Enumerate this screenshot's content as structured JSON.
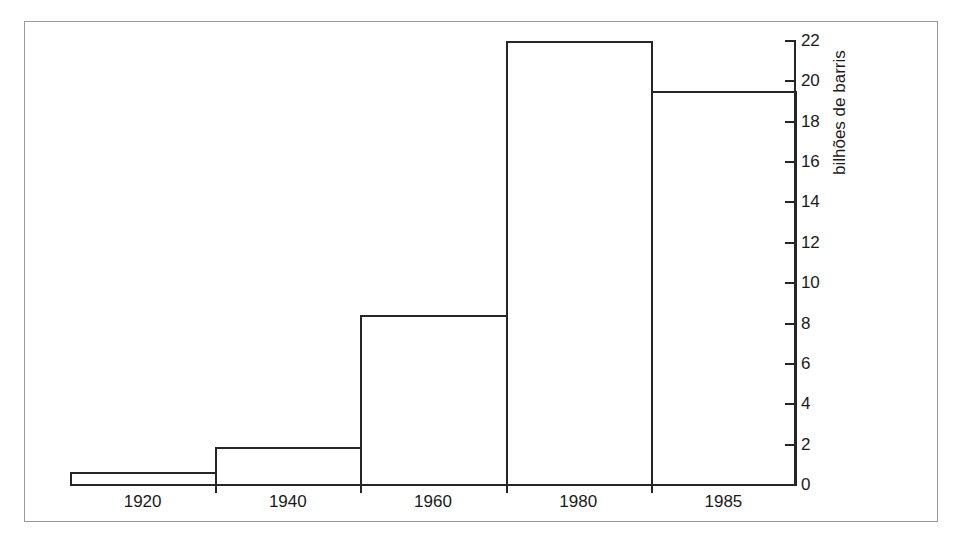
{
  "figure": {
    "background_color": "#ffffff",
    "ink_color": "#262626",
    "frame_color": "#9a9a9a",
    "has_outer_frame": true
  },
  "chart_data": {
    "type": "bar",
    "title": "",
    "subtitle": "",
    "xlabel": "",
    "ylabel": "bilhões de barris",
    "categories": [
      "1920",
      "1940",
      "1960",
      "1980",
      "1985"
    ],
    "values": [
      0.65,
      1.9,
      8.4,
      22.0,
      19.5
    ],
    "series": [
      {
        "name": "bilhões de barris",
        "values": [
          0.65,
          1.9,
          8.4,
          22.0,
          19.5
        ]
      }
    ],
    "ylim": [
      0,
      22
    ],
    "xlim_labels": [
      "1920",
      "1985"
    ],
    "y_ticks": [
      0,
      2,
      4,
      6,
      8,
      10,
      12,
      14,
      16,
      18,
      20,
      22
    ],
    "y_tick_labels": [
      "0",
      "2",
      "4",
      "6",
      "8",
      "10",
      "12",
      "14",
      "16",
      "18",
      "20",
      "22"
    ],
    "x_tick_labels": [
      "1920",
      "1940",
      "1960",
      "1980",
      "1985"
    ],
    "grid": false,
    "legend": false,
    "legend_position": "none",
    "y_axis_position": "right",
    "bar_style": "outline",
    "bar_fill": "none",
    "annotations": []
  },
  "axes": {
    "y_label_text": "bilhões de barris",
    "y_axis_side": "right",
    "y_ticks": [
      {
        "value": 22,
        "label": "22"
      },
      {
        "value": 20,
        "label": "20"
      },
      {
        "value": 18,
        "label": "18"
      },
      {
        "value": 16,
        "label": "16"
      },
      {
        "value": 14,
        "label": "14"
      },
      {
        "value": 12,
        "label": "12"
      },
      {
        "value": 10,
        "label": "10"
      },
      {
        "value": 8,
        "label": "8"
      },
      {
        "value": 6,
        "label": "6"
      },
      {
        "value": 4,
        "label": "4"
      },
      {
        "value": 2,
        "label": "2"
      },
      {
        "value": 0,
        "label": "0"
      }
    ],
    "x_ticks": [
      {
        "label": "1920"
      },
      {
        "label": "1940"
      },
      {
        "label": "1960"
      },
      {
        "label": "1980"
      },
      {
        "label": "1985"
      }
    ]
  }
}
